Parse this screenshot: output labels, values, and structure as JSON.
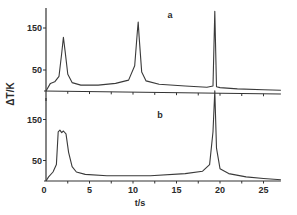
{
  "chart_data": {
    "type": "line",
    "title": "",
    "xlabel": "t/s",
    "ylabel": "ΔT/K",
    "xlim": [
      0,
      27
    ],
    "x_ticks": [
      0,
      5,
      10,
      15,
      20,
      25
    ],
    "x_tick_labels": [
      "0",
      "5",
      "10",
      "15",
      "20",
      "25"
    ],
    "grid": false,
    "panels": [
      {
        "label": "a",
        "ylim": [
          0,
          190
        ],
        "y_ticks": [
          50,
          150
        ],
        "y_tick_labels": [
          "50",
          "150"
        ],
        "series": [
          {
            "name": "a",
            "x": [
              0,
              0.5,
              1.0,
              1.5,
              1.8,
              2.0,
              2.2,
              2.5,
              3.0,
              4.0,
              6.0,
              8.0,
              9.5,
              10.2,
              10.5,
              10.6,
              10.7,
              11.0,
              11.5,
              13.0,
              16.0,
              18.5,
              19.2,
              19.4,
              19.6,
              20.0,
              22.0,
              25.0,
              27.0
            ],
            "y": [
              0,
              18,
              22,
              35,
              90,
              128,
              95,
              40,
              20,
              14,
              14,
              18,
              26,
              60,
              140,
              164,
              130,
              45,
              24,
              16,
              12,
              9,
              12,
              190,
              10,
              8,
              5,
              3,
              2
            ]
          }
        ]
      },
      {
        "label": "b",
        "ylim": [
          0,
          190
        ],
        "y_ticks": [
          50,
          150
        ],
        "y_tick_labels": [
          "50",
          "150"
        ],
        "series": [
          {
            "name": "b",
            "x": [
              0,
              0.3,
              0.8,
              1.2,
              1.4,
              1.6,
              1.8,
              2.0,
              2.3,
              2.6,
              3.0,
              3.5,
              4.5,
              7.0,
              12.0,
              16.0,
              18.0,
              18.8,
              19.2,
              19.4,
              19.6,
              20.0,
              21.0,
              23.0,
              25.0,
              27.0
            ],
            "y": [
              0,
              10,
              22,
              40,
              120,
              124,
              118,
              122,
              115,
              70,
              35,
              22,
              16,
              13,
              13,
              18,
              24,
              40,
              120,
              220,
              80,
              30,
              18,
              10,
              6,
              3
            ]
          }
        ]
      }
    ]
  }
}
